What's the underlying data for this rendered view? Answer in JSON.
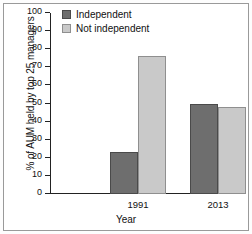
{
  "chart_data": {
    "type": "bar",
    "title": "",
    "xlabel": "Year",
    "ylabel": "% of AUM held by top 25 managers",
    "categories": [
      "1991",
      "2013"
    ],
    "series": [
      {
        "name": "Independent",
        "values": [
          23,
          50
        ],
        "color": "#6e6e6e"
      },
      {
        "name": "Not independent",
        "values": [
          76,
          48
        ],
        "color": "#c9c9c9"
      }
    ],
    "ylim": [
      0,
      100
    ],
    "ytick_step": 10,
    "yticks": [
      "100",
      "90",
      "80",
      "70",
      "60",
      "50",
      "40",
      "30",
      "20",
      "10",
      "0"
    ],
    "grid": false,
    "legend_position": "top-left"
  },
  "legend": {
    "items": [
      {
        "label": "Independent",
        "swatch": "dark-swatch"
      },
      {
        "label": "Not independent",
        "swatch": "light-swatch"
      }
    ]
  }
}
